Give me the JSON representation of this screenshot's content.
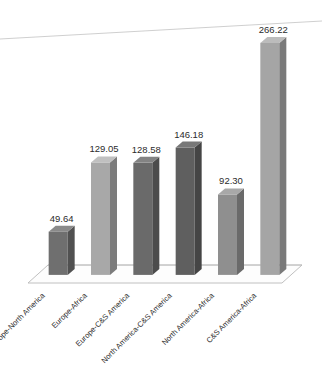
{
  "chart_data": {
    "type": "bar",
    "title": "",
    "subtitle": "",
    "xlabel": "",
    "ylabel": "",
    "ylim": [
      0,
      290
    ],
    "grid": false,
    "legend": "none",
    "style": "3d-column",
    "label_rotation_deg": -45,
    "value_label_format": "2-decimal",
    "categories": [
      "Europe-North America",
      "Europe-Africa",
      "Europe-C&S America",
      "North America-C&S America",
      "North America-Africa",
      "C&S America-Africa"
    ],
    "values": [
      49.64,
      129.05,
      128.58,
      146.18,
      92.3,
      266.22
    ],
    "value_labels": [
      "49.64",
      "129.05",
      "128.58",
      "146.18",
      "92.30",
      "266.22"
    ],
    "bar_colors": [
      "#6f6f6f",
      "#a8a8a8",
      "#6a6a6a",
      "#5f5f5f",
      "#8f8f8f",
      "#a5a5a5"
    ],
    "bar_side_colors": [
      "#515151",
      "#7c7c7c",
      "#4c4c4c",
      "#454545",
      "#6a6a6a",
      "#7a7a7a"
    ],
    "bar_top_colors": [
      "#8a8a8a",
      "#c0c0c0",
      "#838383",
      "#787878",
      "#a8a8a8",
      "#bcbcbc"
    ]
  },
  "canvas": {
    "background": "#ffffff",
    "platform_fill": "#fdfdfd",
    "platform_stroke": "#b9b9b9",
    "gridline_color": "#c9c9c9"
  }
}
